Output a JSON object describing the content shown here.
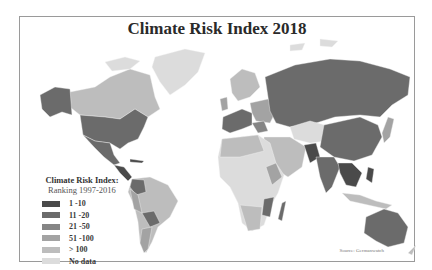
{
  "title": "Climate Risk Index 2018",
  "legend": {
    "title": "Climate Risk Index:",
    "subtitle": "Ranking 1997-2016",
    "items": [
      {
        "label": "1 -10",
        "color": "#4a4a4a"
      },
      {
        "label": "11 -20",
        "color": "#6b6b6b"
      },
      {
        "label": "21 -50",
        "color": "#858585"
      },
      {
        "label": "51 -100",
        "color": "#a3a3a3"
      },
      {
        "label": "> 100",
        "color": "#bdbdbd"
      },
      {
        "label": "No data",
        "color": "#dcdcdc"
      }
    ]
  },
  "source": "Source: Germanwatch",
  "colors": {
    "frame": "#9a9a9a",
    "background": "#ffffff",
    "country_border": "#f4f4f4"
  }
}
